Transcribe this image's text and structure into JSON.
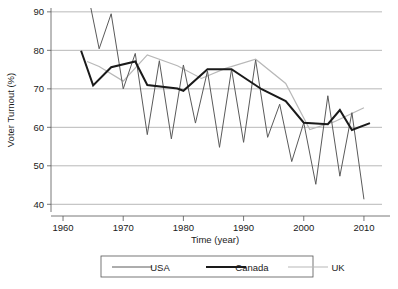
{
  "chart_data": {
    "type": "line",
    "title": "",
    "xlabel": "Time (year)",
    "ylabel": "Voter Turnout (%)",
    "xlim": [
      1958,
      2013
    ],
    "ylim": [
      38,
      91
    ],
    "xticks": [
      1960,
      1970,
      1980,
      1990,
      2000,
      2010
    ],
    "yticks": [
      40,
      50,
      60,
      70,
      80,
      90
    ],
    "grid": "horizontal",
    "legend_position": "bottom-outside",
    "series": [
      {
        "name": "USA",
        "color": "#5a5a5a",
        "width": 1.0,
        "x": [
          1964,
          1966,
          1968,
          1970,
          1972,
          1974,
          1976,
          1978,
          1980,
          1982,
          1984,
          1986,
          1988,
          1990,
          1992,
          1994,
          1996,
          1998,
          2000,
          2002,
          2004,
          2006,
          2008,
          2010
        ],
        "y": [
          95.8,
          80.4,
          89.5,
          70.0,
          79.2,
          58.1,
          77.3,
          57.0,
          76.2,
          61.1,
          74.6,
          54.8,
          75.1,
          56.1,
          77.5,
          57.4,
          66.0,
          51.1,
          61.2,
          45.2,
          68.2,
          47.3,
          63.8,
          41.3
        ]
      },
      {
        "name": "Canada",
        "color": "#1a1a1a",
        "width": 2.0,
        "x": [
          1963,
          1965,
          1968,
          1972,
          1974,
          1979,
          1980,
          1984,
          1988,
          1993,
          1997,
          2000,
          2004,
          2006,
          2008,
          2011
        ],
        "y": [
          79.9,
          70.9,
          75.6,
          77.1,
          71.0,
          70.1,
          69.5,
          75.1,
          75.1,
          69.9,
          66.8,
          61.2,
          60.8,
          64.5,
          59.3,
          61.1
        ]
      },
      {
        "name": "UK",
        "color": "#b8b8b8",
        "width": 1.2,
        "x": [
          1964,
          1966,
          1970,
          1974,
          1979,
          1983,
          1987,
          1992,
          1997,
          2001,
          2005,
          2010
        ],
        "y": [
          77.1,
          75.8,
          72.0,
          78.8,
          76.0,
          72.7,
          75.3,
          77.7,
          71.4,
          59.4,
          61.4,
          65.1
        ]
      }
    ]
  },
  "axes": {
    "ylabel": "Voter Turnout (%)",
    "xlabel": "Time (year)",
    "ytick_labels": [
      "90",
      "80",
      "70",
      "60",
      "50",
      "40"
    ],
    "xtick_labels": [
      "1960",
      "1970",
      "1980",
      "1990",
      "2000",
      "2010"
    ]
  },
  "legend": {
    "items": [
      {
        "label": "USA",
        "color": "#5a5a5a"
      },
      {
        "label": "Canada",
        "color": "#1a1a1a"
      },
      {
        "label": "UK",
        "color": "#b8b8b8"
      }
    ]
  }
}
